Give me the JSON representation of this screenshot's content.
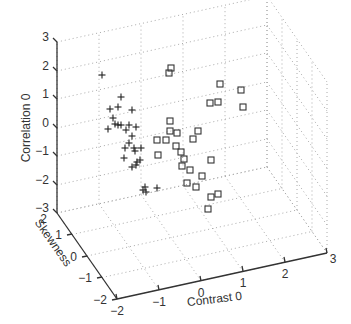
{
  "chart_data": {
    "type": "scatter",
    "projection": "3d",
    "title": "",
    "xlabel": "Contrast 0",
    "ylabel": "Skewness",
    "zlabel": "Correlation 0",
    "xlim": [
      -2,
      3
    ],
    "ylim": [
      -2,
      2
    ],
    "zlim": [
      -3,
      3
    ],
    "x_ticks": [
      "-2",
      "-1",
      "0",
      "1",
      "2",
      "3"
    ],
    "y_ticks": [
      "2",
      "1",
      "0",
      "-1",
      "-2"
    ],
    "z_ticks": [
      "3",
      "2",
      "1",
      "0",
      "-1",
      "-2",
      "-3"
    ],
    "grid": true,
    "legend": null,
    "series": [
      {
        "name": "class-plus",
        "marker": "+",
        "screen_points": [
          [
            102,
            75
          ],
          [
            121,
            97
          ],
          [
            118,
            107
          ],
          [
            110,
            109
          ],
          [
            132,
            110
          ],
          [
            113,
            118
          ],
          [
            115,
            124
          ],
          [
            118,
            125
          ],
          [
            121,
            125
          ],
          [
            129,
            125
          ],
          [
            136,
            127
          ],
          [
            108,
            129
          ],
          [
            126,
            130
          ],
          [
            132,
            136
          ],
          [
            129,
            143
          ],
          [
            125,
            148
          ],
          [
            134,
            148
          ],
          [
            141,
            148
          ],
          [
            135,
            151
          ],
          [
            124,
            158
          ],
          [
            137,
            162
          ],
          [
            136,
            165
          ],
          [
            140,
            160
          ],
          [
            132,
            167
          ],
          [
            143,
            190
          ],
          [
            146,
            192
          ],
          [
            145,
            187
          ],
          [
            157,
            188
          ]
        ]
      },
      {
        "name": "class-square",
        "marker": "square",
        "screen_points": [
          [
            171,
            68
          ],
          [
            169,
            73
          ],
          [
            220,
            84
          ],
          [
            241,
            90
          ],
          [
            170,
            121
          ],
          [
            210,
            103
          ],
          [
            218,
            102
          ],
          [
            243,
            107
          ],
          [
            170,
            131
          ],
          [
            177,
            133
          ],
          [
            198,
            131
          ],
          [
            157,
            140
          ],
          [
            166,
            140
          ],
          [
            176,
            146
          ],
          [
            181,
            152
          ],
          [
            193,
            139
          ],
          [
            184,
            159
          ],
          [
            158,
            155
          ],
          [
            182,
            166
          ],
          [
            211,
            160
          ],
          [
            190,
            170
          ],
          [
            202,
            176
          ],
          [
            187,
            183
          ],
          [
            196,
            187
          ],
          [
            218,
            194
          ],
          [
            208,
            209
          ],
          [
            211,
            197
          ]
        ]
      }
    ]
  },
  "axes": {
    "z": {
      "label": "Correlation 0",
      "ticks": [
        {
          "label": "3",
          "x": 57,
          "y": 42
        },
        {
          "label": "2",
          "x": 57,
          "y": 71
        },
        {
          "label": "1",
          "x": 57,
          "y": 99
        },
        {
          "label": "0",
          "x": 57,
          "y": 128
        },
        {
          "label": "-1",
          "x": 57,
          "y": 156
        },
        {
          "label": "-2",
          "x": 57,
          "y": 185
        },
        {
          "label": "-3",
          "x": 57,
          "y": 213
        }
      ]
    },
    "y": {
      "label": "Skewness",
      "ticks": [
        {
          "label": "2",
          "x": 57,
          "y": 213
        },
        {
          "label": "1",
          "x": 72,
          "y": 234
        },
        {
          "label": "0",
          "x": 87,
          "y": 256
        },
        {
          "label": "-1",
          "x": 102,
          "y": 277
        },
        {
          "label": "-2",
          "x": 117,
          "y": 299
        }
      ]
    },
    "x": {
      "label": "Contrast 0",
      "ticks": [
        {
          "label": "-2",
          "x": 117,
          "y": 299
        },
        {
          "label": "-1",
          "x": 159,
          "y": 290
        },
        {
          "label": "0",
          "x": 201,
          "y": 281
        },
        {
          "label": "1",
          "x": 243,
          "y": 271
        },
        {
          "label": "2",
          "x": 285,
          "y": 262
        },
        {
          "label": "3",
          "x": 327,
          "y": 253
        }
      ]
    }
  }
}
